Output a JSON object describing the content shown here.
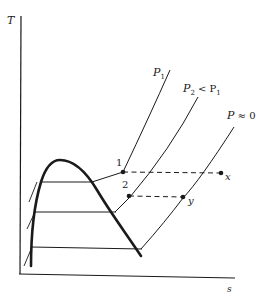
{
  "diagram": {
    "axes": {
      "y_label": "T",
      "x_label": "s"
    },
    "isobars": [
      {
        "id": "p1",
        "label_main": "P",
        "label_sub": "1",
        "label_rest": ""
      },
      {
        "id": "p2",
        "label_main": "P",
        "label_sub": "2",
        "label_rest": " < P",
        "label_rest_sub": "1"
      },
      {
        "id": "p0",
        "label_main": "P",
        "label_sub": "",
        "label_rest": " ≈ 0"
      }
    ],
    "points": [
      {
        "id": "1",
        "label": "1"
      },
      {
        "id": "x",
        "label": "x"
      },
      {
        "id": "2",
        "label": "2"
      },
      {
        "id": "y",
        "label": "y"
      }
    ],
    "connections": [
      {
        "from": "1",
        "to": "x",
        "style": "dashed"
      },
      {
        "from": "2",
        "to": "y",
        "style": "dashed"
      }
    ],
    "colors": {
      "ink": "#1a1a1a",
      "background": "#ffffff"
    }
  }
}
